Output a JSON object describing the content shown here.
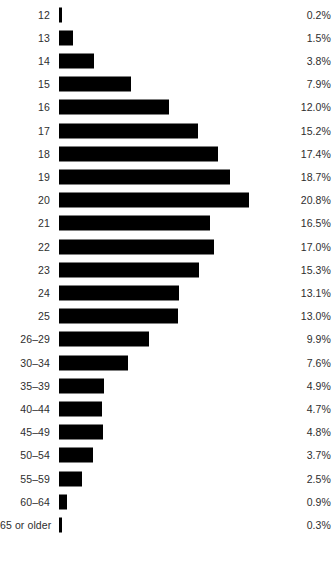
{
  "chart_data": {
    "type": "bar",
    "orientation": "horizontal",
    "title": "",
    "subtitle": "",
    "xlabel": "",
    "ylabel": "",
    "grid": false,
    "legend": false,
    "bar_color": "#000000",
    "text_color": "#2e2e2e",
    "background": "#ffffff",
    "xlim": [
      0,
      20.8
    ],
    "value_suffix": "%",
    "categories": [
      "12",
      "13",
      "14",
      "15",
      "16",
      "17",
      "18",
      "19",
      "20",
      "21",
      "22",
      "23",
      "24",
      "25",
      "26–29",
      "30–34",
      "35–39",
      "40–44",
      "45–49",
      "50–54",
      "55–59",
      "60–64",
      "65 or older"
    ],
    "values": [
      0.2,
      1.5,
      3.8,
      7.9,
      12.0,
      15.2,
      17.4,
      18.7,
      20.8,
      16.5,
      17.0,
      15.3,
      13.1,
      13.0,
      9.9,
      7.6,
      4.9,
      4.7,
      4.8,
      3.7,
      2.5,
      0.9,
      0.3
    ],
    "value_labels": [
      "0.2%",
      "1.5%",
      "3.8%",
      "7.9%",
      "12.0%",
      "15.2%",
      "17.4%",
      "18.7%",
      "20.8%",
      "16.5%",
      "17.0%",
      "15.3%",
      "13.1%",
      "13.0%",
      "9.9%",
      "7.6%",
      "4.9%",
      "4.7%",
      "4.8%",
      "3.7%",
      "2.5%",
      "0.9%",
      "0.3%"
    ]
  }
}
